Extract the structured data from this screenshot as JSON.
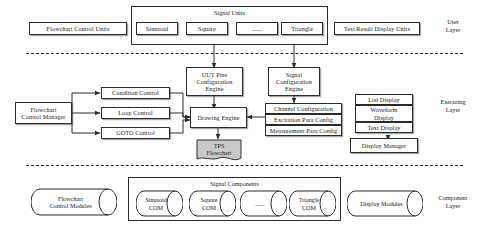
{
  "diagram": {
    "type": "block-diagram",
    "layers": [
      {
        "id": "user",
        "label": "User\nLayer"
      },
      {
        "id": "executing",
        "label": "Executing\nLayer"
      },
      {
        "id": "component",
        "label": "Component\nLayer"
      }
    ],
    "user_layer": {
      "flowchart_control_units": "Flowchart Control Units",
      "signal_units_group": "Signal Units",
      "signal_units": [
        {
          "label": "Sinusoid"
        },
        {
          "label": "Square"
        },
        {
          "label": "......"
        },
        {
          "label": "Triangle"
        }
      ],
      "test_result_display_units": "Test Result Display Units"
    },
    "executing_layer": {
      "uut_pins_engine": "UUT Pins\nConfiguration\nEngine",
      "signal_config_engine": "Signal\nConfiguration\nEngine",
      "flowchart_control_manager": "Flowchart\nControl Manager",
      "controls": [
        {
          "label": "Condition Control"
        },
        {
          "label": "Loop Control"
        },
        {
          "label": "GOTO Control"
        }
      ],
      "drawing_engine": "Drawing Engine",
      "tps_flowchart": "TPS\nFlowchart",
      "configs": [
        {
          "label": "Channel Configuration"
        },
        {
          "label": "Excitation Para Config"
        },
        {
          "label": "Measurement Para Config"
        }
      ],
      "displays": [
        {
          "label": "List Display"
        },
        {
          "label": "Waveform\nDisplay"
        },
        {
          "label": "Text Display"
        }
      ],
      "display_manager": "Display Manager"
    },
    "component_layer": {
      "flowchart_control_modules": "Flowchart\nControl Modules",
      "signal_components_group": "Signal Components",
      "signal_components": [
        {
          "label": "Sinusoid\nCOM"
        },
        {
          "label": "Square\nCOM"
        },
        {
          "label": "......"
        },
        {
          "label": "Triangle\nCOM"
        }
      ],
      "display_modules": "Display Modules"
    },
    "colors": {
      "line": "#2b2b2b",
      "background": "#ffffff",
      "tps_fill": "#c9c9c9"
    }
  }
}
